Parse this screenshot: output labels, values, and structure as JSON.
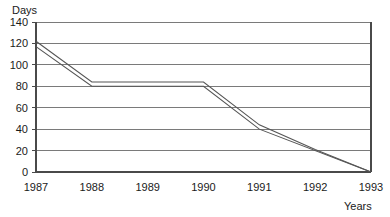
{
  "chart_data": {
    "type": "line",
    "title": "",
    "xlabel": "Years",
    "ylabel": "Days",
    "x": [
      1987,
      1988,
      1989,
      1990,
      1991,
      1992,
      1993
    ],
    "xlim": [
      1987,
      1993
    ],
    "ylim": [
      0,
      140
    ],
    "ytick_labels": [
      "0",
      "20",
      "40",
      "60",
      "80",
      "100",
      "120",
      "140"
    ],
    "ytick_values": [
      0,
      20,
      40,
      60,
      80,
      100,
      120,
      140
    ],
    "xtick_labels": [
      "1987",
      "1988",
      "1989",
      "1990",
      "1991",
      "1992",
      "1993"
    ],
    "grid": "horizontal",
    "legend": "none",
    "series": [
      {
        "name": "upper-line",
        "points": [
          {
            "x": 1987,
            "y": 122
          },
          {
            "x": 1988,
            "y": 84
          },
          {
            "x": 1990,
            "y": 84
          },
          {
            "x": 1991,
            "y": 44
          },
          {
            "x": 1992,
            "y": 21
          },
          {
            "x": 1993,
            "y": 0
          }
        ]
      },
      {
        "name": "lower-line",
        "points": [
          {
            "x": 1987,
            "y": 117
          },
          {
            "x": 1988,
            "y": 80
          },
          {
            "x": 1990,
            "y": 80
          },
          {
            "x": 1991,
            "y": 40
          },
          {
            "x": 1993,
            "y": 0
          }
        ]
      }
    ]
  },
  "axes": {
    "y_title": "Days",
    "x_title": "Years"
  },
  "y_ticks": [
    {
      "label": "140"
    },
    {
      "label": "120"
    },
    {
      "label": "100"
    },
    {
      "label": "80"
    },
    {
      "label": "60"
    },
    {
      "label": "40"
    },
    {
      "label": "20"
    },
    {
      "label": "0"
    }
  ],
  "x_ticks": [
    {
      "label": "1987"
    },
    {
      "label": "1988"
    },
    {
      "label": "1989"
    },
    {
      "label": "1990"
    },
    {
      "label": "1991"
    },
    {
      "label": "1992"
    },
    {
      "label": "1993"
    }
  ],
  "colors": {
    "line": "#555555",
    "grid": "#7a7a7a",
    "axis": "#4a4a4a",
    "text": "#1a1a1a",
    "background": "#ffffff"
  }
}
